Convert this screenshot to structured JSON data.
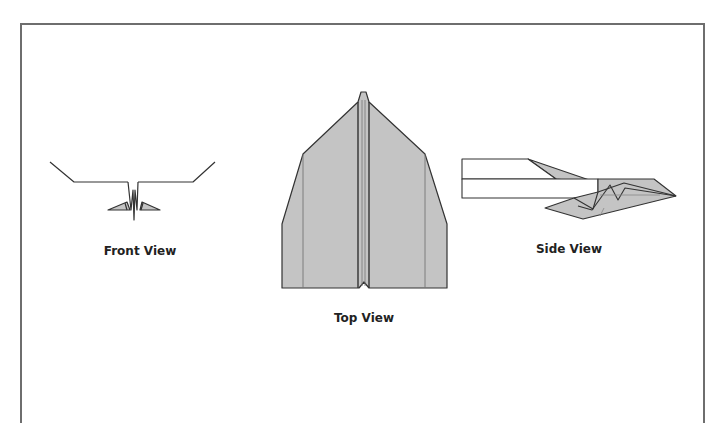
{
  "diagram": {
    "views": [
      {
        "id": "front",
        "label": "Front View"
      },
      {
        "id": "top",
        "label": "Top View"
      },
      {
        "id": "side",
        "label": "Side View"
      }
    ],
    "colors": {
      "fill": "#c4c4c4",
      "stroke": "#333333",
      "frame": "#6e6e6e",
      "background": "#ffffff"
    }
  }
}
